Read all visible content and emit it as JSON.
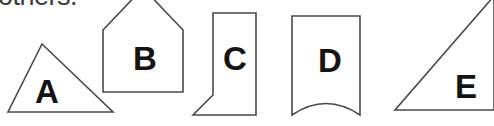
{
  "image": {
    "width": 494,
    "height": 126,
    "background_color": "#ffffff",
    "stroke_color": "#4a4a4a",
    "label_color": "#141414",
    "text_color": "#3b3b3b"
  },
  "cropped_text": {
    "content": "others."
  },
  "shapes": [
    {
      "id": "shape-a",
      "label": "A",
      "kind": "triangle",
      "label_x": 47,
      "label_y": 91,
      "points": "42,44 113,112 8,112"
    },
    {
      "id": "shape-b",
      "label": "B",
      "kind": "pentagon-house",
      "label_x": 145,
      "label_y": 58,
      "points": "103,30 143,-12 183,30 183,92 103,92"
    },
    {
      "id": "shape-c",
      "label": "C",
      "kind": "quadrilateral",
      "label_x": 235,
      "label_y": 58,
      "points": "213,13 256,13 256,115 193,115 213,95"
    },
    {
      "id": "shape-d",
      "label": "D",
      "kind": "banner-concave-bottom",
      "label_x": 330,
      "label_y": 60,
      "path": "M 292,16 L 360,16 L 360,115 Q 326,92 292,115 Z"
    },
    {
      "id": "shape-e",
      "label": "E",
      "kind": "right-triangle",
      "label_x": 466,
      "label_y": 86,
      "points": "395,110 494,110 494,-4"
    }
  ]
}
